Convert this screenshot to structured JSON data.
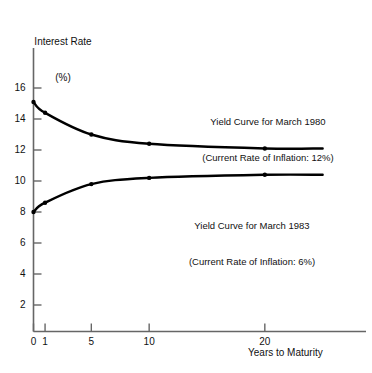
{
  "chart_data": {
    "type": "line",
    "title": "",
    "xlabel": "Years to Maturity",
    "ylabel": "Interest Rate\n(%)",
    "ylabel_line1": "Interest Rate",
    "ylabel_line2": "(%)",
    "xlim": [
      0,
      26.5
    ],
    "ylim": [
      0,
      17.2
    ],
    "grid": false,
    "legend": "inline-annotations",
    "xticks": [
      0,
      1,
      5,
      10,
      20
    ],
    "xtick_labels": [
      "0",
      "1",
      "5",
      "10",
      "20"
    ],
    "yticks": [
      2,
      4,
      6,
      8,
      10,
      12,
      14,
      16
    ],
    "ytick_labels": [
      "2",
      "4",
      "6",
      "8",
      "10",
      "12",
      "14",
      "16"
    ],
    "series": [
      {
        "name": "Yield Curve for March 1980",
        "annotation_line1": "Yield Curve for March 1980",
        "annotation_line2": "(Current Rate of Inflation: 12%)",
        "inflation_rate": "12%",
        "color": "#000000",
        "x": [
          0,
          1,
          5,
          10,
          20,
          25
        ],
        "values": [
          15.1,
          14.4,
          13.0,
          12.4,
          12.1,
          12.1
        ],
        "markers_x": [
          0,
          1,
          5,
          10,
          20
        ]
      },
      {
        "name": "Yield Curve for March 1983",
        "annotation_line1": "Yield Curve for March 1983",
        "annotation_line2": "(Current Rate of Inflation: 6%)",
        "inflation_rate": "6%",
        "color": "#000000",
        "x": [
          0,
          1,
          5,
          10,
          20,
          25
        ],
        "values": [
          8.0,
          8.6,
          9.8,
          10.2,
          10.4,
          10.4
        ],
        "markers_x": [
          0,
          1,
          5,
          10,
          20
        ]
      }
    ]
  },
  "axes": {
    "y_title_line1": "Interest Rate",
    "y_title_line2": "(%)",
    "x_title": "Years to Maturity"
  },
  "annotations": {
    "curve_1980_line1": "Yield Curve for March 1980",
    "curve_1980_line2": "(Current Rate of Inflation: 12%)",
    "curve_1983_line1": "Yield Curve for March 1983",
    "curve_1983_line2": "(Current Rate of Inflation: 6%)"
  },
  "colors": {
    "curve": "#000000",
    "axis": "#555555",
    "text": "#111111",
    "background": "#ffffff"
  }
}
